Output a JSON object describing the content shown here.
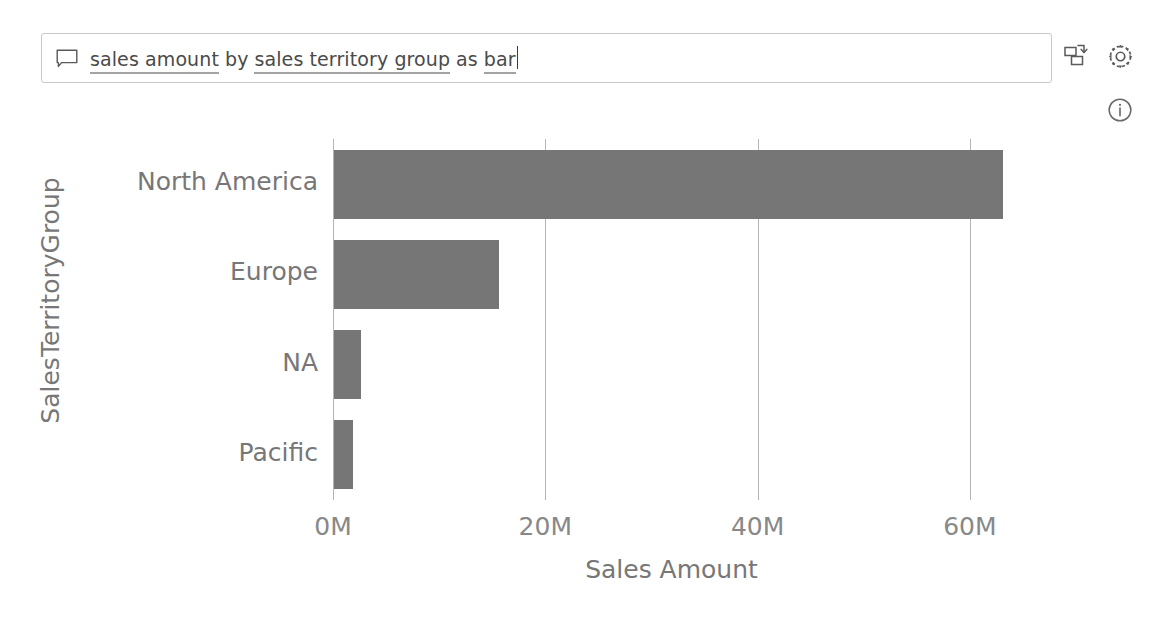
{
  "qna": {
    "icon": "speech-bubble-icon",
    "query_tokens": [
      {
        "text": "sales amount",
        "underlined": true
      },
      {
        "text": "by",
        "underlined": false
      },
      {
        "text": "sales territory group",
        "underlined": true
      },
      {
        "text": "as",
        "underlined": false
      },
      {
        "text": "bar",
        "underlined": true
      }
    ],
    "full_query": "sales amount by sales territory group as bar",
    "caret_visible": true,
    "actions": [
      {
        "name": "convert-visual-button",
        "icon": "convert-to-visual-icon",
        "label": ""
      },
      {
        "name": "settings-button",
        "icon": "gear-icon",
        "label": ""
      },
      {
        "name": "info-button",
        "icon": "info-circle-icon",
        "label": ""
      }
    ]
  },
  "chart_data": {
    "type": "bar",
    "orientation": "horizontal",
    "title": "",
    "xlabel": "Sales Amount",
    "ylabel": "SalesTerritoryGroup",
    "categories": [
      "North America",
      "Europe",
      "NA",
      "Pacific"
    ],
    "values": [
      63000000,
      15500000,
      2500000,
      1800000
    ],
    "tick_labels": [
      "0M",
      "20M",
      "40M",
      "60M"
    ],
    "tick_values": [
      0,
      20000000,
      40000000,
      60000000
    ],
    "xlim": [
      0,
      65000000
    ],
    "grid": true,
    "legend": false,
    "bar_color": "#767676",
    "axis_color": "#b5b5b5",
    "text_color": "#777777"
  }
}
